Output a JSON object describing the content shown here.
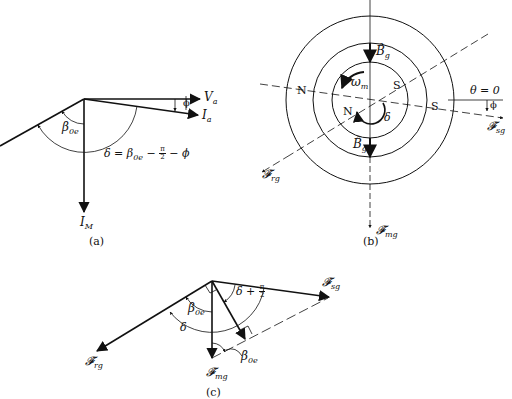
{
  "panels": {
    "a": {
      "caption": "(a)",
      "labels": {
        "Va": "V",
        "Va_sub": "a",
        "Ia": "I",
        "Ia_sub": "a",
        "IM": "I",
        "IM_sub": "M",
        "phi": "ϕ",
        "beta": "β",
        "beta_sub": "0e",
        "delta_eq_lhs": "δ = β",
        "delta_eq_sub": "0e",
        "delta_eq_mid": " − ",
        "delta_eq_frac_num": "π",
        "delta_eq_frac_den": "2",
        "delta_eq_rhs": " − ϕ"
      }
    },
    "b": {
      "caption": "(b)",
      "labels": {
        "Bg_top": "B̂",
        "Bg_top_sub": "g",
        "Bg_bottom": "B̂",
        "Bg_bottom_sub": "g",
        "omega": "ω",
        "omega_sub": "m",
        "delta": "δ",
        "N_left": "N",
        "N_inner": "N",
        "S_inner": "S",
        "S_right": "S",
        "theta_zero": "θ = 0",
        "phi": "ϕ",
        "Fsg": "𝓕̂",
        "Fsg_sub": "sg",
        "Frg": "𝓕̂",
        "Frg_sub": "rg",
        "Fmg": "𝓕̂",
        "Fmg_sub": "mg"
      }
    },
    "c": {
      "caption": "(c)",
      "labels": {
        "Fsg": "𝓕̂",
        "Fsg_sub": "sg",
        "Frg": "𝓕̂",
        "Frg_sub": "rg",
        "Fmg": "𝓕̂",
        "Fmg_sub": "mg",
        "delta": "δ",
        "beta_upper": "β",
        "beta_upper_sub": "0e",
        "beta_lower": "β",
        "beta_lower_sub": "0e",
        "delta_plus": "δ + ",
        "frac_num": "π",
        "frac_den": "2"
      }
    }
  },
  "colors": {
    "ink": "#111111",
    "background": "#ffffff"
  }
}
